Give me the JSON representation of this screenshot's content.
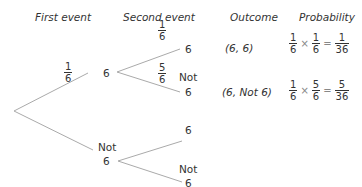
{
  "headers": {
    "first_event": "First event",
    "second_event": "Second event",
    "outcome": "Outcome",
    "probability": "Probability"
  },
  "tree": {
    "root_branches": [
      {
        "node": "6",
        "prefix": "",
        "prob_num": "1",
        "prob_den": "6"
      },
      {
        "node": "6",
        "prefix": "Not",
        "prob_num": "",
        "prob_den": ""
      }
    ],
    "upper_children": [
      {
        "node": "6",
        "prefix": "",
        "prob_num": "1",
        "prob_den": "6"
      },
      {
        "node": "6",
        "prefix": "Not",
        "prob_num": "5",
        "prob_den": "6"
      }
    ],
    "lower_children": [
      {
        "node": "6",
        "prefix": ""
      },
      {
        "node": "6",
        "prefix": "Not"
      }
    ]
  },
  "outcomes": [
    {
      "label": "(6, 6)",
      "a_num": "1",
      "a_den": "6",
      "times": "×",
      "b_num": "1",
      "b_den": "6",
      "equals": "=",
      "r_num": "1",
      "r_den": "36"
    },
    {
      "label": "(6, Not 6)",
      "a_num": "1",
      "a_den": "6",
      "times": "×",
      "b_num": "5",
      "b_den": "6",
      "equals": "=",
      "r_num": "5",
      "r_den": "36"
    }
  ],
  "colors": {
    "line": "#aaaaaa",
    "text": "#333333"
  }
}
